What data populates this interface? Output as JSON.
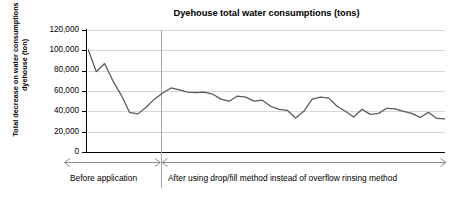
{
  "chart_data": {
    "type": "line",
    "title": "Dyehouse total water consumptions (tons)",
    "xlabel": "",
    "ylabel": "Total decrease on water consumptions of dyehouse (ton)",
    "ylim": [
      0,
      120000
    ],
    "yticks": [
      0,
      20000,
      40000,
      60000,
      80000,
      100000,
      120000
    ],
    "ytick_labels": [
      "0",
      "20,000",
      "40,000",
      "60,000",
      "80,000",
      "100,000",
      "120,000"
    ],
    "grid": true,
    "legend": false,
    "series": [
      {
        "name": "Dyehouse total water consumption",
        "color": "#595959",
        "values": [
          101000,
          79000,
          87000,
          70000,
          56000,
          39000,
          37500,
          44000,
          52000,
          58000,
          63000,
          61000,
          59000,
          58500,
          59000,
          57000,
          52000,
          50000,
          55000,
          54000,
          50000,
          51000,
          45000,
          42000,
          41000,
          33500,
          40000,
          52000,
          54000,
          53000,
          45000,
          40000,
          34500,
          42000,
          37000,
          38000,
          43000,
          42500,
          40000,
          38000,
          34000,
          39000,
          33000,
          32500
        ]
      }
    ],
    "annotations": {
      "divider_label": "",
      "before_label": "Before application",
      "after_label": "After using drop/fill method instead of overflow rinsing method",
      "divider_index": 7
    }
  },
  "axis": {
    "tick_labels": [
      "120,000",
      "100,000",
      "80,000",
      "60,000",
      "40,000",
      "20,000",
      "0"
    ]
  },
  "title": "Dyehouse total water consumptions (tons)",
  "ytitle": "Total decrease on water consumptions of dyehouse (ton)",
  "captions": {
    "before": "Before application",
    "after": "After using drop/fill method instead of overflow rinsing method"
  },
  "colors": {
    "line": "#595959",
    "grid": "#d6d6d6",
    "axis": "#000000",
    "divider": "#a8a8a8",
    "arrow": "#8c8c8c"
  }
}
